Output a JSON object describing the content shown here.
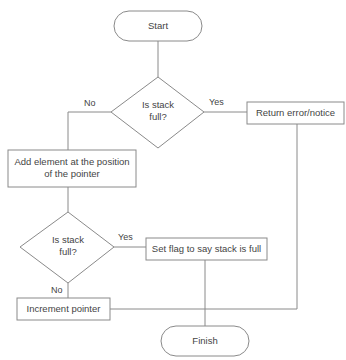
{
  "diagram": {
    "type": "flowchart",
    "nodes": {
      "start": {
        "label": "Start",
        "shape": "terminal"
      },
      "decision1": {
        "label_line1": "Is stack",
        "label_line2": "full?",
        "shape": "decision"
      },
      "return_error": {
        "label": "Return error/notice",
        "shape": "process"
      },
      "add_element": {
        "label_line1": "Add element at the position",
        "label_line2": "of the pointer",
        "shape": "process"
      },
      "decision2": {
        "label_line1": "Is stack",
        "label_line2": "full?",
        "shape": "decision"
      },
      "set_flag": {
        "label": "Set flag to say stack is full",
        "shape": "process"
      },
      "increment": {
        "label": "Increment pointer",
        "shape": "process"
      },
      "finish": {
        "label": "Finish",
        "shape": "terminal"
      }
    },
    "edges": {
      "d1_no": "No",
      "d1_yes": "Yes",
      "d2_yes": "Yes",
      "d2_no": "No"
    },
    "colors": {
      "stroke": "#8a8a8a",
      "text": "#444444",
      "background": "#ffffff"
    }
  }
}
